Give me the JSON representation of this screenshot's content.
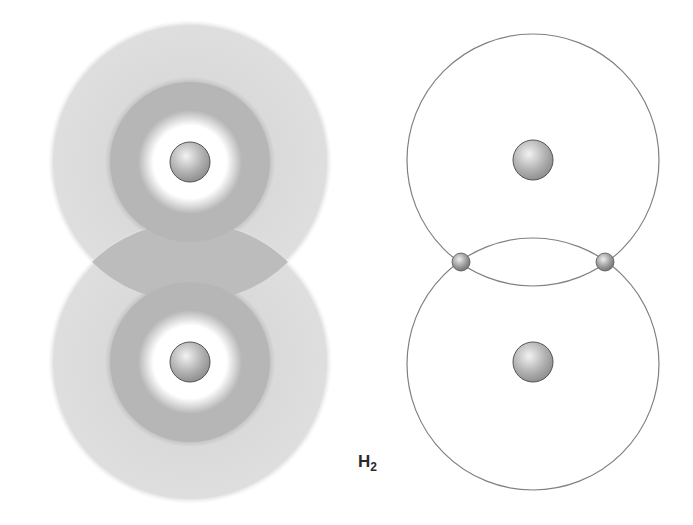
{
  "diagram": {
    "title": "H2",
    "label_main": "H",
    "label_sub": "2",
    "left_panel": {
      "description": "electron density clouds of two hydrogen atoms overlapping",
      "atoms": [
        {
          "cx": 190,
          "cy": 162
        },
        {
          "cx": 190,
          "cy": 362
        }
      ],
      "cloud_outer_radius": 140,
      "cloud_ring_radius": 80,
      "cloud_core_radius": 42,
      "nucleus_radius": 20,
      "colors": {
        "outer": "#dcdcdc",
        "ring": "#b4b4b4",
        "overlap": "#bdbdbd",
        "nucleus": "#a9a9a9"
      }
    },
    "right_panel": {
      "description": "Bohr-style orbits of two hydrogen atoms sharing electrons",
      "atoms": [
        {
          "cx": 533,
          "cy": 160
        },
        {
          "cx": 533,
          "cy": 362
        }
      ],
      "orbit_radius": 126,
      "nucleus_radius": 20,
      "electrons": [
        {
          "cx": 461,
          "cy": 262
        },
        {
          "cx": 605,
          "cy": 262
        }
      ],
      "electron_radius": 9,
      "colors": {
        "orbit": "#808080",
        "nucleus": "#a9a9a9",
        "electron": "#8f8f8f"
      }
    }
  }
}
